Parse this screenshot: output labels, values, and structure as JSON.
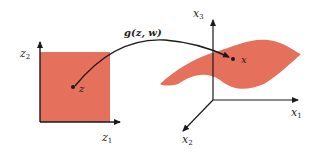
{
  "colors": {
    "region_fill": "#e5705c",
    "axis": "#1a1a1a",
    "background": "#ffffff"
  },
  "latent_space": {
    "axis_x_label": "z",
    "axis_x_sub": "1",
    "axis_y_label": "z",
    "axis_y_sub": "2",
    "point_label": "z"
  },
  "mapping": {
    "label": "g(z, w)"
  },
  "data_space": {
    "axis_1_label": "x",
    "axis_1_sub": "1",
    "axis_2_label": "x",
    "axis_2_sub": "2",
    "axis_3_label": "x",
    "axis_3_sub": "3",
    "point_label": "x"
  }
}
